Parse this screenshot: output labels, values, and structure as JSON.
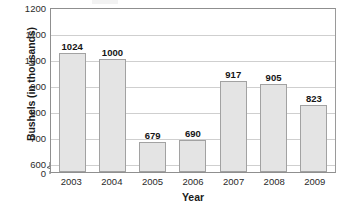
{
  "chart_data": {
    "type": "bar",
    "title": "",
    "xlabel": "Year",
    "ylabel": "Bushels (in thousands)",
    "categories": [
      "2003",
      "2004",
      "2005",
      "2006",
      "2007",
      "2008",
      "2009"
    ],
    "values": [
      1024,
      1000,
      679,
      690,
      917,
      905,
      823
    ],
    "series": [
      {
        "name": "Bushels",
        "values": [
          1024,
          1000,
          679,
          690,
          917,
          905,
          823
        ]
      }
    ],
    "data_labels": [
      "1024",
      "1000",
      "679",
      "690",
      "917",
      "905",
      "823"
    ],
    "yticks": [
      "1200",
      "1100",
      "1000",
      "900",
      "800",
      "700",
      "600",
      "0"
    ],
    "ytick_values": [
      1200,
      1100,
      1000,
      900,
      800,
      700,
      600,
      0
    ],
    "ylim": [
      600,
      1200
    ],
    "y_axis_broken": true,
    "grid": "horizontal",
    "legend": "none",
    "bar_fill_color": "#e4e4e4",
    "bar_border_color": "#a2a2a2",
    "gridline_color": "#cfcfcf",
    "axis_color": "#8f8f8f",
    "text_color": "#1b1b1b"
  }
}
